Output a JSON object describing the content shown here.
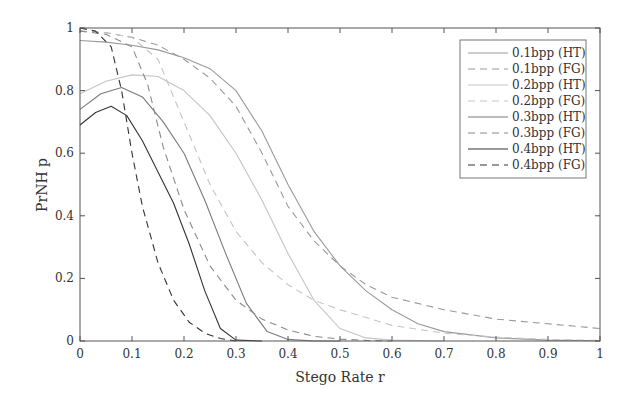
{
  "chart_data": {
    "type": "line",
    "title": "",
    "xlabel": "Stego Rate r",
    "ylabel": "PrNH p",
    "xlim": [
      0,
      1
    ],
    "ylim": [
      0,
      1
    ],
    "xticks": [
      "0",
      "0.1",
      "0.2",
      "0.3",
      "0.4",
      "0.5",
      "0.6",
      "0.7",
      "0.8",
      "0.9",
      "1"
    ],
    "yticks": [
      "0",
      "0.2",
      "0.4",
      "0.6",
      "0.8",
      "1"
    ],
    "grid": false,
    "legend_position": "upper right",
    "series": [
      {
        "name": "0.1bpp (HT)",
        "color": "#9a9a9a",
        "dash": "solid",
        "x": [
          0,
          0.05,
          0.1,
          0.15,
          0.2,
          0.25,
          0.3,
          0.35,
          0.4,
          0.45,
          0.5,
          0.55,
          0.6,
          0.65,
          0.7,
          0.8,
          0.9,
          1.0
        ],
        "y": [
          0.96,
          0.955,
          0.945,
          0.93,
          0.905,
          0.87,
          0.8,
          0.67,
          0.5,
          0.35,
          0.24,
          0.16,
          0.1,
          0.055,
          0.03,
          0.01,
          0.003,
          0.001
        ]
      },
      {
        "name": "0.1bpp (FG)",
        "color": "#9a9a9a",
        "dash": "dashed",
        "x": [
          0,
          0.05,
          0.1,
          0.15,
          0.2,
          0.25,
          0.3,
          0.35,
          0.4,
          0.45,
          0.5,
          0.55,
          0.6,
          0.7,
          0.8,
          0.9,
          1.0
        ],
        "y": [
          0.99,
          0.985,
          0.97,
          0.945,
          0.9,
          0.84,
          0.75,
          0.6,
          0.43,
          0.32,
          0.24,
          0.18,
          0.14,
          0.1,
          0.07,
          0.055,
          0.04
        ]
      },
      {
        "name": "0.2bpp (HT)",
        "color": "#c4c4c4",
        "dash": "solid",
        "x": [
          0,
          0.05,
          0.1,
          0.15,
          0.2,
          0.25,
          0.3,
          0.35,
          0.4,
          0.45,
          0.5,
          0.55,
          0.6,
          0.7
        ],
        "y": [
          0.79,
          0.83,
          0.85,
          0.845,
          0.8,
          0.72,
          0.6,
          0.45,
          0.28,
          0.13,
          0.04,
          0.01,
          0.003,
          0
        ]
      },
      {
        "name": "0.2bpp (FG)",
        "color": "#c4c4c4",
        "dash": "dashed",
        "x": [
          0,
          0.05,
          0.1,
          0.15,
          0.2,
          0.25,
          0.3,
          0.35,
          0.4,
          0.45,
          0.5,
          0.6,
          0.7,
          0.8,
          0.9,
          1.0
        ],
        "y": [
          0.99,
          0.985,
          0.97,
          0.9,
          0.7,
          0.5,
          0.35,
          0.25,
          0.18,
          0.13,
          0.1,
          0.05,
          0.025,
          0.012,
          0.005,
          0.002
        ]
      },
      {
        "name": "0.3bpp (HT)",
        "color": "#7a7a7a",
        "dash": "solid",
        "x": [
          0,
          0.04,
          0.08,
          0.12,
          0.16,
          0.2,
          0.24,
          0.28,
          0.32,
          0.36,
          0.4,
          0.45,
          0.5
        ],
        "y": [
          0.74,
          0.79,
          0.81,
          0.78,
          0.7,
          0.6,
          0.45,
          0.28,
          0.12,
          0.03,
          0.005,
          0,
          0
        ]
      },
      {
        "name": "0.3bpp (FG)",
        "color": "#8a8a8a",
        "dash": "dashed",
        "x": [
          0,
          0.05,
          0.1,
          0.13,
          0.16,
          0.2,
          0.25,
          0.3,
          0.35,
          0.4,
          0.45,
          0.5,
          0.55,
          0.6
        ],
        "y": [
          0.99,
          0.98,
          0.94,
          0.82,
          0.62,
          0.42,
          0.24,
          0.13,
          0.07,
          0.035,
          0.015,
          0.006,
          0.002,
          0
        ]
      },
      {
        "name": "0.4bpp (HT)",
        "color": "#333333",
        "dash": "solid",
        "x": [
          0,
          0.03,
          0.06,
          0.09,
          0.12,
          0.15,
          0.18,
          0.21,
          0.24,
          0.27,
          0.3,
          0.35
        ],
        "y": [
          0.69,
          0.73,
          0.75,
          0.72,
          0.64,
          0.54,
          0.44,
          0.31,
          0.16,
          0.04,
          0.003,
          0
        ]
      },
      {
        "name": "0.4bpp (FG)",
        "color": "#333333",
        "dash": "dashed",
        "x": [
          0,
          0.03,
          0.06,
          0.08,
          0.1,
          0.12,
          0.15,
          0.18,
          0.21,
          0.24,
          0.27,
          0.3
        ],
        "y": [
          1.0,
          0.99,
          0.94,
          0.8,
          0.6,
          0.43,
          0.25,
          0.13,
          0.06,
          0.025,
          0.008,
          0
        ]
      }
    ]
  }
}
